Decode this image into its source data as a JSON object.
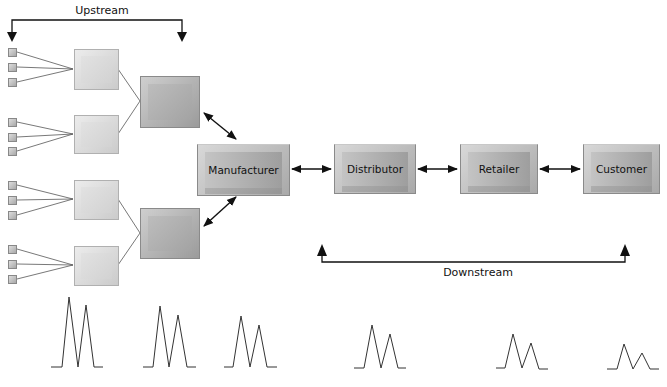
{
  "labels": {
    "upstream": "Upstream",
    "downstream": "Downstream"
  },
  "nodes": {
    "manufacturer": "Manufacturer",
    "distributor": "Distributor",
    "retailer": "Retailer",
    "customer": "Customer"
  },
  "structure": {
    "tier1_suppliers": 2,
    "tier2_suppliers": 4,
    "tier3_suppliers_per_tier2": 3
  },
  "demand_waveforms": [
    {
      "stage": 1,
      "peak1_height": 70,
      "peak2_height": 62
    },
    {
      "stage": 2,
      "peak1_height": 61,
      "peak2_height": 52
    },
    {
      "stage": 3,
      "peak1_height": 51,
      "peak2_height": 42
    },
    {
      "stage": 4,
      "peak1_height": 42,
      "peak2_height": 33
    },
    {
      "stage": 5,
      "peak1_height": 34,
      "peak2_height": 25
    },
    {
      "stage": 6,
      "peak1_height": 25,
      "peak2_height": 16
    }
  ]
}
